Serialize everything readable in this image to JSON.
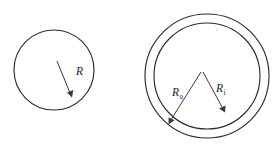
{
  "figure": {
    "name": "circle-and-annulus-radius-diagram",
    "background_color": "#ffffff",
    "stroke_color": "#2b2b2b",
    "label_color": "#1d1d1d",
    "width": 274,
    "height": 147
  },
  "left_shape": {
    "name": "solid-circle",
    "center_x": 54,
    "center_y": 70,
    "radius": 40,
    "label": {
      "base": "R",
      "subscript": "",
      "x": 76,
      "y": 75
    },
    "arrow": {
      "from_x": 57,
      "from_y": 61,
      "to_x": 72,
      "to_y": 97
    }
  },
  "right_shape": {
    "name": "annulus",
    "center_x": 207,
    "center_y": 76,
    "outer_radius": 62,
    "inner_radius": 53,
    "outer_label": {
      "base": "R",
      "subscript": "o",
      "x": 172,
      "y": 96
    },
    "inner_label": {
      "base": "R",
      "subscript": "i",
      "x": 216,
      "y": 92
    },
    "outer_arrow": {
      "from_x": 201,
      "from_y": 72,
      "to_x": 169,
      "to_y": 124
    },
    "inner_arrow": {
      "from_x": 203,
      "from_y": 72,
      "to_x": 225,
      "to_y": 112
    }
  }
}
